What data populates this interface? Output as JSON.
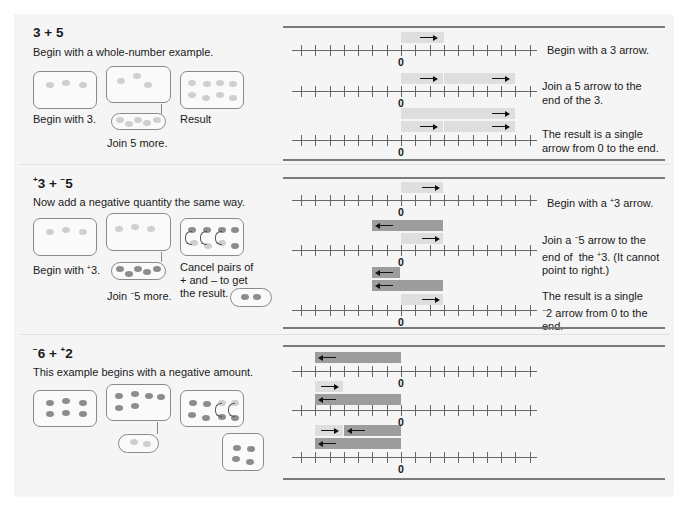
{
  "sections": [
    {
      "id": "three-plus-five",
      "title_parts": {
        "a_sign": "",
        "a": "3",
        "op": " + ",
        "b_sign": "",
        "b": "5"
      },
      "subtitle": "Begin with a whole-number example.",
      "labels": {
        "begin": "Begin with 3.",
        "join": "Join 5 more.",
        "result": "Result"
      },
      "steps": [
        {
          "text": "Begin with a 3 arrow."
        },
        {
          "text": "Join a 5 arrow to the\nend of the 3."
        },
        {
          "text": "The result is a single\narrow from 0 to the end."
        }
      ]
    },
    {
      "id": "pos3-plus-neg5",
      "title_parts": {
        "a_sign": "+",
        "a": "3",
        "op": " + ",
        "b_sign": "−",
        "b": "5"
      },
      "subtitle": "Now add a negative quantity the same way.",
      "labels": {
        "begin_pre": "Begin with ",
        "begin_sign": "+",
        "begin_post": "3.",
        "join_pre": "Join ",
        "join_sign": "−",
        "join_post": "5 more.",
        "cancel": "Cancel pairs of\n+ and – to get\nthe result."
      },
      "steps": [
        {
          "pre": "Begin with a ",
          "sign": "+",
          "post": "3 arrow."
        },
        {
          "pre": "Join a ",
          "sign": "−",
          "mid": "5 arrow to the\nend of  the ",
          "sign2": "+",
          "post": "3. (It cannot\npoint to right.)"
        },
        {
          "pre": "The result is a single\n",
          "sign": "−",
          "post": "2 arrow from 0 to the\nend."
        }
      ]
    },
    {
      "id": "neg6-plus-pos2",
      "title_parts": {
        "a_sign": "−",
        "a": "6",
        "op": " + ",
        "b_sign": "+",
        "b": "2"
      },
      "subtitle": "This example begins with a negative amount."
    }
  ],
  "number_line": {
    "min_tick": -7,
    "max_tick": 9,
    "zero_label": "0"
  },
  "colors": {
    "positive_bar": "#dedede",
    "negative_bar": "#9d9d9d",
    "positive_counter": "#cfcfcf",
    "negative_counter": "#8c8c8c",
    "panel_bg": "#f5f5f5"
  },
  "chart_data": {
    "type": "number-line-arrows",
    "examples": [
      {
        "expression": "3 + 5",
        "rows": [
          {
            "bars": [
              {
                "from": 0,
                "to": 3,
                "sign": "+"
              }
            ]
          },
          {
            "bars": [
              {
                "from": 0,
                "to": 3,
                "sign": "+"
              },
              {
                "from": 3,
                "to": 8,
                "sign": "+"
              }
            ]
          },
          {
            "bars": [
              {
                "from": 0,
                "to": 8,
                "sign": "+"
              },
              {
                "from": 0,
                "to": 3,
                "sign": "+"
              },
              {
                "from": 3,
                "to": 8,
                "sign": "+"
              }
            ]
          }
        ],
        "result": 8
      },
      {
        "expression": "+3 + -5",
        "rows": [
          {
            "bars": [
              {
                "from": 0,
                "to": 3,
                "sign": "+"
              }
            ]
          },
          {
            "bars": [
              {
                "from": 3,
                "to": -2,
                "sign": "-"
              },
              {
                "from": 0,
                "to": 3,
                "sign": "+"
              }
            ]
          },
          {
            "bars": [
              {
                "from": 0,
                "to": -2,
                "sign": "-"
              },
              {
                "from": 3,
                "to": -2,
                "sign": "-"
              },
              {
                "from": 0,
                "to": 3,
                "sign": "+"
              }
            ]
          }
        ],
        "result": -2
      },
      {
        "expression": "-6 + +2",
        "rows": [
          {
            "bars": [
              {
                "from": 0,
                "to": -6,
                "sign": "-"
              }
            ]
          },
          {
            "bars": [
              {
                "from": -6,
                "to": -4,
                "sign": "+"
              },
              {
                "from": 0,
                "to": -6,
                "sign": "-"
              }
            ]
          },
          {
            "bars": [
              {
                "from": -6,
                "to": -4,
                "sign": "+"
              },
              {
                "from": 0,
                "to": -4,
                "sign": "-"
              },
              {
                "from": 0,
                "to": -6,
                "sign": "-"
              }
            ]
          }
        ],
        "result": -4
      }
    ]
  }
}
